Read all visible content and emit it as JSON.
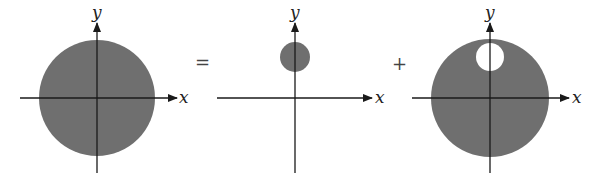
{
  "colors": {
    "fill": "#6f6f6f",
    "axis": "#1a1a1a",
    "hole": "#ffffff"
  },
  "operators": {
    "equals": "=",
    "plus": "+"
  },
  "panels": [
    {
      "id": "full-disk",
      "x_label": "x",
      "y_label": "y",
      "origin": [
        97,
        98
      ],
      "disk": {
        "cx": 97,
        "cy": 98,
        "r": 58
      }
    },
    {
      "id": "small-disk",
      "x_label": "x",
      "y_label": "y",
      "origin": [
        295,
        98
      ],
      "disk": {
        "cx": 295,
        "cy": 57,
        "r": 15
      }
    },
    {
      "id": "disk-with-hole",
      "x_label": "x",
      "y_label": "y",
      "origin": [
        490,
        98
      ],
      "disk": {
        "cx": 490,
        "cy": 98,
        "r": 59
      },
      "hole": {
        "cx": 490,
        "cy": 57,
        "r": 14
      }
    }
  ]
}
